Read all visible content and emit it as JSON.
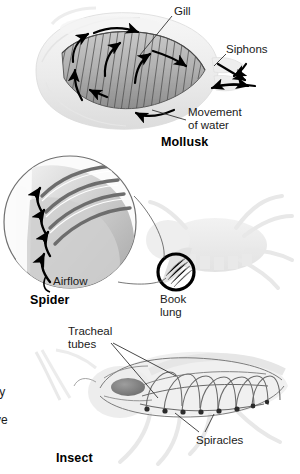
{
  "figure": {
    "type": "biology-diagram",
    "background_color": "#ffffff",
    "ink_color": "#1a1a1a",
    "panels": [
      {
        "id": "mollusk",
        "caption": "Mollusk",
        "labels": [
          {
            "id": "gill",
            "text": "Gill"
          },
          {
            "id": "siphons",
            "text": "Siphons"
          },
          {
            "id": "movement-of-water-line1",
            "text": "Movement"
          },
          {
            "id": "movement-of-water-line2",
            "text": "of water"
          }
        ]
      },
      {
        "id": "spider",
        "caption": "Spider",
        "labels": [
          {
            "id": "airflow",
            "text": "Airflow"
          },
          {
            "id": "book-lung-line1",
            "text": "Book"
          },
          {
            "id": "book-lung-line2",
            "text": "lung"
          }
        ]
      },
      {
        "id": "insect",
        "caption": "Insect",
        "labels": [
          {
            "id": "tracheal-tubes-line1",
            "text": "Tracheal"
          },
          {
            "id": "tracheal-tubes-line2",
            "text": "tubes"
          },
          {
            "id": "spiracles",
            "text": "Spiracles"
          }
        ]
      }
    ],
    "clipped_margin_text": [
      {
        "id": "clip-top",
        "text": "ty"
      },
      {
        "id": "clip-bottom",
        "text": "ve"
      }
    ]
  }
}
